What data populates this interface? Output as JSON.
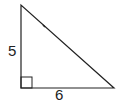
{
  "diagram": {
    "type": "right-triangle",
    "vertical_leg_label": "5",
    "horizontal_leg_label": "6",
    "right_angle_marker": true,
    "stroke_color": "#222222"
  }
}
